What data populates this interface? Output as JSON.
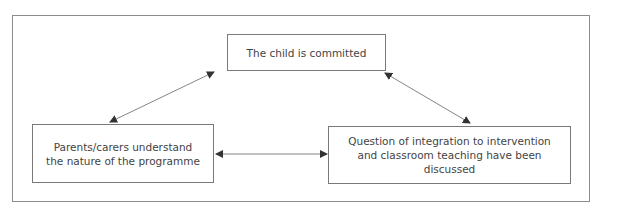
{
  "diagram": {
    "nodes": [
      {
        "id": "top",
        "lines": [
          "The child is committed"
        ]
      },
      {
        "id": "left",
        "lines": [
          "Parents/carers understand",
          "the nature of the programme"
        ]
      },
      {
        "id": "right",
        "lines": [
          "Question of integration to intervention",
          "and classroom teaching have been",
          "discussed"
        ]
      }
    ],
    "edges": [
      {
        "from": "top",
        "to": "left",
        "type": "bidirectional"
      },
      {
        "from": "top",
        "to": "right",
        "type": "bidirectional"
      },
      {
        "from": "left",
        "to": "right",
        "type": "bidirectional"
      }
    ],
    "colors": {
      "border": "#7a7a7a",
      "arrow": "#555555",
      "text": "#444444"
    }
  }
}
